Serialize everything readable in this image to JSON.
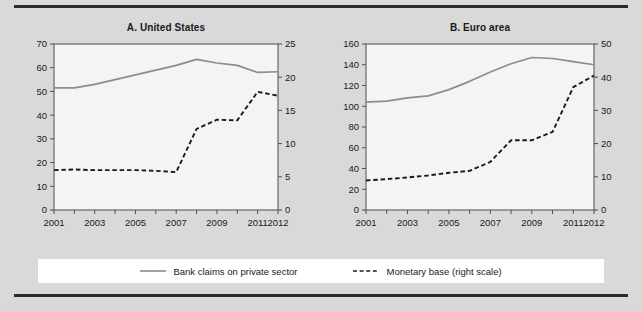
{
  "figure": {
    "background_color": "#d9d9d9",
    "plot_background_color": "#f4f4f4",
    "rule_color": "#2b2b2b"
  },
  "legend": {
    "position": "bottom-center",
    "background_color": "#ffffff",
    "items": [
      {
        "label": "Bank claims on private sector",
        "style": "solid",
        "color": "#8c8c8c",
        "swatch": "solid-line-swatch"
      },
      {
        "label": "Monetary base (right scale)",
        "style": "dashed",
        "color": "#1a1a1a",
        "swatch": "dashed-line-swatch"
      }
    ]
  },
  "chart_data": [
    {
      "type": "line",
      "panel": "A",
      "title": "A. United States",
      "xlabel": "",
      "ylabel": "",
      "x": [
        2001,
        2002,
        2003,
        2004,
        2005,
        2006,
        2007,
        2008,
        2009,
        2010,
        2011,
        2012
      ],
      "xlim": [
        2001,
        2012
      ],
      "xticks": [
        2001,
        2002,
        2003,
        2004,
        2005,
        2006,
        2007,
        2008,
        2009,
        2010,
        2011,
        2012
      ],
      "xticklabels": [
        "2001",
        "",
        "2003",
        "",
        "2005",
        "",
        "2007",
        "",
        "2009",
        "",
        "2011",
        "2012"
      ],
      "ylim": [
        0,
        70
      ],
      "yticks": [
        0,
        10,
        20,
        30,
        40,
        50,
        60,
        70
      ],
      "yticklabels": [
        "0",
        "10",
        "20",
        "30",
        "40",
        "50",
        "60",
        "70"
      ],
      "y2lim": [
        0,
        25
      ],
      "y2ticks": [
        0,
        5,
        10,
        15,
        20,
        25
      ],
      "y2ticklabels": [
        "0",
        "5",
        "10",
        "15",
        "20",
        "25"
      ],
      "grid": false,
      "series": [
        {
          "name": "Bank claims on private sector",
          "axis": "left",
          "style": "solid",
          "color": "#8c8c8c",
          "values": [
            51.5,
            51.5,
            53.0,
            55.0,
            57.0,
            59.0,
            61.0,
            63.5,
            62.0,
            61.0,
            58.0,
            58.3
          ]
        },
        {
          "name": "Monetary base (right scale)",
          "axis": "right",
          "style": "dashed",
          "color": "#1a1a1a",
          "values": [
            6.0,
            6.1,
            6.0,
            6.0,
            6.0,
            5.9,
            5.7,
            12.2,
            13.6,
            13.5,
            17.8,
            17.2
          ]
        }
      ]
    },
    {
      "type": "line",
      "panel": "B",
      "title": "B. Euro area",
      "xlabel": "",
      "ylabel": "",
      "x": [
        2001,
        2002,
        2003,
        2004,
        2005,
        2006,
        2007,
        2008,
        2009,
        2010,
        2011,
        2012
      ],
      "xlim": [
        2001,
        2012
      ],
      "xticks": [
        2001,
        2002,
        2003,
        2004,
        2005,
        2006,
        2007,
        2008,
        2009,
        2010,
        2011,
        2012
      ],
      "xticklabels": [
        "2001",
        "",
        "2003",
        "",
        "2005",
        "",
        "2007",
        "",
        "2009",
        "",
        "2011",
        "2012"
      ],
      "ylim": [
        0,
        160
      ],
      "yticks": [
        0,
        20,
        40,
        60,
        80,
        100,
        120,
        140,
        160
      ],
      "yticklabels": [
        "0",
        "20",
        "40",
        "60",
        "80",
        "100",
        "120",
        "140",
        "160"
      ],
      "y2lim": [
        0,
        50
      ],
      "y2ticks": [
        0,
        10,
        20,
        30,
        40,
        50
      ],
      "y2ticklabels": [
        "0",
        "10",
        "20",
        "30",
        "40",
        "50"
      ],
      "grid": false,
      "series": [
        {
          "name": "Bank claims on private sector",
          "axis": "left",
          "style": "solid",
          "color": "#8c8c8c",
          "values": [
            104.0,
            105.0,
            108.0,
            110.0,
            116.0,
            124.0,
            133.0,
            141.0,
            147.0,
            146.0,
            143.0,
            140.0
          ]
        },
        {
          "name": "Monetary base (right scale)",
          "axis": "right",
          "style": "dashed",
          "color": "#1a1a1a",
          "values": [
            8.9,
            9.3,
            9.8,
            10.4,
            11.2,
            11.8,
            14.5,
            21.0,
            21.0,
            23.5,
            37.0,
            40.5
          ]
        }
      ]
    }
  ]
}
